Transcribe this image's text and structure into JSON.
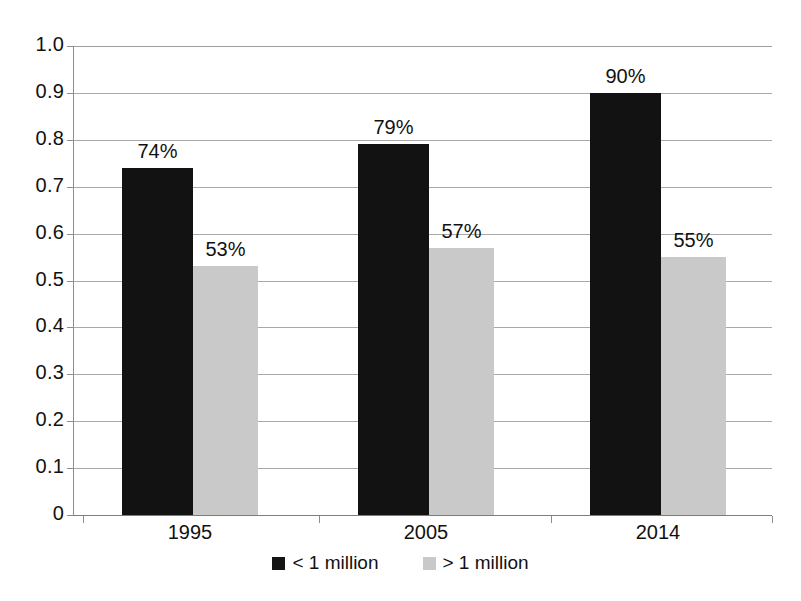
{
  "chart_data": {
    "type": "bar",
    "title": "",
    "xlabel": "",
    "ylabel": "",
    "categories": [
      "1995",
      "2005",
      "2014"
    ],
    "series": [
      {
        "name": "< 1 million",
        "color": "#121212",
        "values": [
          0.74,
          0.79,
          0.9
        ],
        "labels": [
          "74%",
          "79%",
          "90%"
        ]
      },
      {
        "name": "> 1 million",
        "color": "#c9c9c9",
        "values": [
          0.53,
          0.57,
          0.55
        ],
        "labels": [
          "53%",
          "57%",
          "55%"
        ]
      }
    ],
    "ylim": [
      0,
      1.0
    ],
    "ytick_values": [
      1.0,
      0.9,
      0.8,
      0.7,
      0.6,
      0.5,
      0.4,
      0.3,
      0.2,
      0.1,
      0
    ],
    "ytick_labels": [
      "1.0",
      "0.9",
      "0.8",
      "0.7",
      "0.6",
      "0.5",
      "0.4",
      "0.3",
      "0.2",
      "0.1",
      "0"
    ],
    "grid": true,
    "legend_position": "bottom"
  },
  "legend": {
    "items": [
      {
        "label": "< 1 million",
        "swatch": "dark"
      },
      {
        "label": "> 1 million",
        "swatch": "light"
      }
    ]
  }
}
